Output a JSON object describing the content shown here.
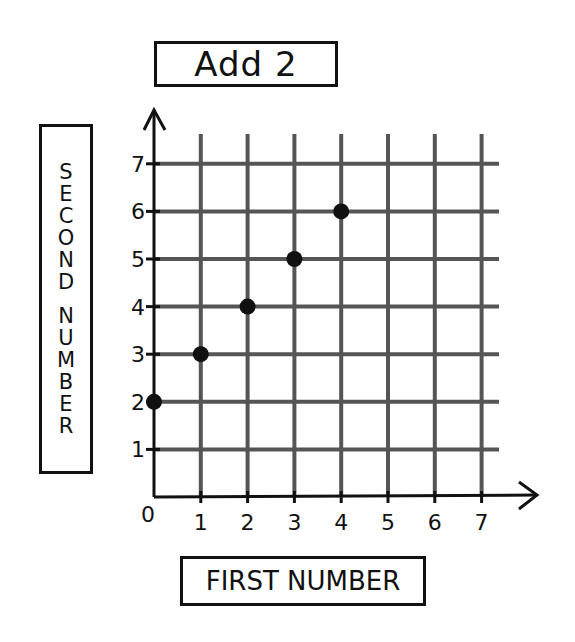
{
  "chart_data": {
    "type": "scatter",
    "title": "Add 2",
    "xlabel": "FIRST NUMBER",
    "ylabel": "SECOND NUMBER",
    "x": [
      0,
      1,
      2,
      3,
      4
    ],
    "y": [
      2,
      3,
      4,
      5,
      6
    ],
    "series": [
      {
        "name": "Add 2",
        "x": [
          0,
          1,
          2,
          3,
          4
        ],
        "y": [
          2,
          3,
          4,
          5,
          6
        ]
      }
    ],
    "xlim": [
      0,
      7
    ],
    "ylim": [
      0,
      7
    ],
    "x_ticks": [
      "0",
      "1",
      "2",
      "3",
      "4",
      "5",
      "6",
      "7"
    ],
    "y_ticks": [
      "1",
      "2",
      "3",
      "4",
      "5",
      "6",
      "7"
    ],
    "grid": true,
    "legend": null
  },
  "labels": {
    "title": "Add 2",
    "x_axis": "FIRST NUMBER",
    "y_axis_letters_1": [
      "S",
      "E",
      "C",
      "O",
      "N",
      "D"
    ],
    "y_axis_letters_2": [
      "N",
      "U",
      "M",
      "B",
      "E",
      "R"
    ]
  },
  "colors": {
    "grid": "#555555",
    "axis": "#111111",
    "point": "#111111",
    "background": "#ffffff"
  }
}
